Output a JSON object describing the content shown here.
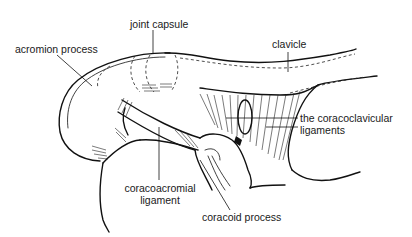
{
  "diagram": {
    "labels": {
      "joint_capsule": "joint capsule",
      "acromion_process": "acromion process",
      "clavicle": "clavicle",
      "coracoclavicular_line1": "the coracoclavicular",
      "coracoclavicular_line2": "ligaments",
      "coracoacromial_line1": "coracoacromial",
      "coracoacromial_line2": "ligament",
      "coracoid_process": "coracoid process"
    },
    "colors": {
      "line": "#111111",
      "background": "#ffffff",
      "text": "#1a1a1a"
    }
  }
}
